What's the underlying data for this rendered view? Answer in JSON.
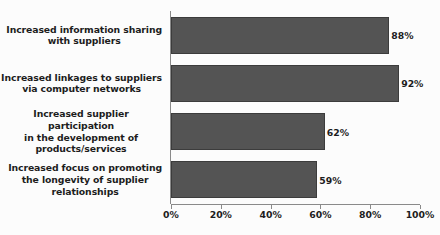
{
  "chart_data": {
    "type": "bar",
    "orientation": "horizontal",
    "title": "",
    "subtitle": "",
    "xlabel": "",
    "ylabel": "",
    "xlim": [
      0,
      100
    ],
    "grid": false,
    "legend": null,
    "categories": [
      "Increased information sharing\nwith suppliers",
      "Increased linkages to suppliers\nvia computer networks",
      "Increased supplier participation\nin the development of\nproducts/services",
      "Increased focus on promoting\nthe longevity of supplier\nrelationships"
    ],
    "values": [
      88,
      92,
      62,
      59
    ],
    "value_labels": [
      "88%",
      "92%",
      "62%",
      "59%"
    ],
    "xticks": [
      0,
      20,
      40,
      60,
      80,
      100
    ],
    "xtick_labels": [
      "0%",
      "20%",
      "40%",
      "60%",
      "80%",
      "100%"
    ],
    "colors": {
      "bar_fill": "#545454",
      "bar_border": "#3c3c3c",
      "axis": "#8a8a8a",
      "text": "#1d1d1d",
      "background": "#fcfcfc"
    }
  }
}
